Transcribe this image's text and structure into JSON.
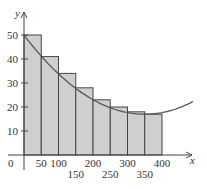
{
  "chart_data": {
    "type": "bar",
    "subtype": "riemann-sum-left-endpoints-with-curve",
    "title": "",
    "xlabel": "x",
    "ylabel": "y",
    "x_ticks_top_row": [
      "50",
      "100",
      "200",
      "300",
      "400"
    ],
    "x_ticks_bottom_row": [
      "150",
      "250",
      "350"
    ],
    "x_ticks": [
      50,
      100,
      150,
      200,
      250,
      300,
      350,
      400
    ],
    "y_ticks": [
      10,
      20,
      30,
      40,
      50
    ],
    "origin_label": "0",
    "xlim": [
      0,
      490
    ],
    "ylim": [
      0,
      55
    ],
    "grid": false,
    "bars": {
      "bin_edges": [
        0,
        50,
        100,
        150,
        200,
        250,
        300,
        350,
        400
      ],
      "values": [
        50,
        41,
        34,
        28,
        23,
        20,
        18,
        17
      ],
      "fill": "#cfcfcf",
      "stroke": "#444444"
    },
    "curve": {
      "description": "decreasing then increasing curve, minimum about 17 near x=350",
      "points": [
        [
          0,
          50
        ],
        [
          50,
          41.2
        ],
        [
          100,
          33.8
        ],
        [
          150,
          27.8
        ],
        [
          200,
          23.1
        ],
        [
          250,
          19.7
        ],
        [
          300,
          17.7
        ],
        [
          350,
          17
        ],
        [
          400,
          17.7
        ],
        [
          450,
          19.7
        ],
        [
          490,
          22.3
        ]
      ],
      "stroke": "#555555"
    },
    "legend": null
  },
  "axes": {
    "x_label": "x",
    "y_label": "y",
    "origin": "0"
  }
}
